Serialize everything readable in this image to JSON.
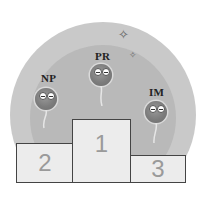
{
  "illustration": {
    "type": "podium-ranking",
    "background_colors": {
      "outer": "#c9c9c9",
      "inner": "#b9b9b9"
    },
    "contestants": [
      {
        "label": "PR",
        "place": 1
      },
      {
        "label": "NP",
        "place": 2
      },
      {
        "label": "IM",
        "place": 3
      }
    ],
    "podium": [
      {
        "place_label": "2"
      },
      {
        "place_label": "1"
      },
      {
        "place_label": "3"
      }
    ],
    "decorations": [
      "sparkle-icon",
      "sparkle-icon"
    ]
  }
}
